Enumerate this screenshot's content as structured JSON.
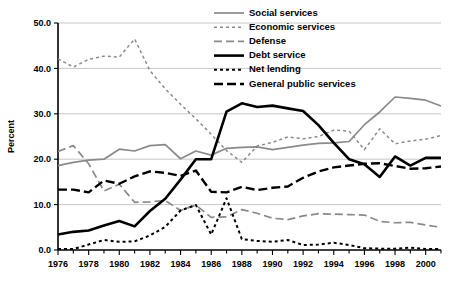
{
  "chart_data": {
    "type": "line",
    "title": "",
    "xlabel": "",
    "ylabel": "Percent",
    "xlim": [
      1976,
      2001
    ],
    "ylim": [
      0.0,
      50.0
    ],
    "ytick_step": 10.0,
    "xtick_step": 2,
    "grid": "horizontal",
    "legend_position": "top-right",
    "ytick_labels": [
      "50.0",
      "40.0",
      "30.0",
      "20.0",
      "10.0",
      "0.0"
    ],
    "ytick_values": [
      50.0,
      40.0,
      30.0,
      20.0,
      10.0,
      0.0
    ],
    "xtick_labels": [
      "1976",
      "1978",
      "1980",
      "1982",
      "1984",
      "1986",
      "1988",
      "1990",
      "1992",
      "1994",
      "1996",
      "1998",
      "2000"
    ],
    "xtick_values": [
      1976,
      1978,
      1980,
      1982,
      1984,
      1986,
      1988,
      1990,
      1992,
      1994,
      1996,
      1998,
      2000
    ],
    "x": [
      1976,
      1977,
      1978,
      1979,
      1980,
      1981,
      1982,
      1983,
      1984,
      1985,
      1986,
      1987,
      1988,
      1989,
      1990,
      1991,
      1992,
      1993,
      1994,
      1995,
      1996,
      1997,
      1998,
      1999,
      2000,
      2001
    ],
    "series": [
      {
        "name": "Social services",
        "color": "#8a8a8a",
        "dash": "none",
        "width": 1.7,
        "values": [
          18.6,
          19.3,
          19.8,
          20.0,
          22.2,
          21.8,
          23.0,
          23.2,
          20.1,
          21.8,
          20.9,
          22.4,
          22.6,
          22.7,
          22.1,
          22.6,
          23.1,
          23.5,
          23.6,
          23.9,
          27.6,
          30.4,
          33.7,
          33.4,
          33.0,
          31.7
        ]
      },
      {
        "name": "Economic services",
        "color": "#8a8a8a",
        "dash": "3,3",
        "width": 1.5,
        "values": [
          42.1,
          40.3,
          42.0,
          42.7,
          42.5,
          46.5,
          39.5,
          35.5,
          32.1,
          28.9,
          25.5,
          21.9,
          19.3,
          22.9,
          23.7,
          24.9,
          24.5,
          25.0,
          26.4,
          26.2,
          22.1,
          26.7,
          23.4,
          24.0,
          24.4,
          25.2
        ]
      },
      {
        "name": "Defense",
        "color": "#8a8a8a",
        "dash": "8,4",
        "width": 1.7,
        "values": [
          21.7,
          23.0,
          19.0,
          13.0,
          14.5,
          10.5,
          10.6,
          10.9,
          8.7,
          9.9,
          7.2,
          7.3,
          8.9,
          8.1,
          7.0,
          6.7,
          7.5,
          8.0,
          7.9,
          7.8,
          7.7,
          6.3,
          6.0,
          6.1,
          5.5,
          5.0
        ]
      },
      {
        "name": "Debt service",
        "color": "#000000",
        "dash": "none",
        "width": 2.6,
        "values": [
          3.4,
          4.0,
          4.3,
          5.4,
          6.4,
          5.2,
          8.6,
          11.3,
          15.5,
          20.0,
          20.0,
          30.5,
          32.3,
          31.5,
          31.8,
          31.2,
          30.6,
          27.5,
          23.6,
          20.0,
          18.9,
          16.1,
          20.6,
          18.6,
          20.3,
          20.3
        ]
      },
      {
        "name": "Net lending",
        "color": "#000000",
        "dash": "3,3",
        "width": 2.0,
        "values": [
          0.2,
          0.2,
          1.2,
          2.2,
          1.8,
          1.9,
          3.2,
          5.1,
          8.7,
          9.9,
          3.4,
          11.4,
          2.4,
          2.0,
          1.8,
          2.2,
          1.1,
          1.2,
          1.6,
          1.1,
          0.4,
          0.3,
          0.3,
          0.5,
          0.2,
          0.2
        ]
      },
      {
        "name": "General public services",
        "color": "#000000",
        "dash": "9,4",
        "width": 2.4,
        "values": [
          13.3,
          13.3,
          12.7,
          15.3,
          14.6,
          16.2,
          17.3,
          17.0,
          16.3,
          17.5,
          12.8,
          12.7,
          13.9,
          13.2,
          13.7,
          14.0,
          15.9,
          17.3,
          18.2,
          18.6,
          19.0,
          19.1,
          18.5,
          17.9,
          18.0,
          18.4
        ]
      }
    ]
  },
  "legend": {
    "items": [
      {
        "label": "Social services"
      },
      {
        "label": "Economic services"
      },
      {
        "label": "Defense"
      },
      {
        "label": "Debt service"
      },
      {
        "label": "Net lending"
      },
      {
        "label": "General public services"
      }
    ]
  }
}
